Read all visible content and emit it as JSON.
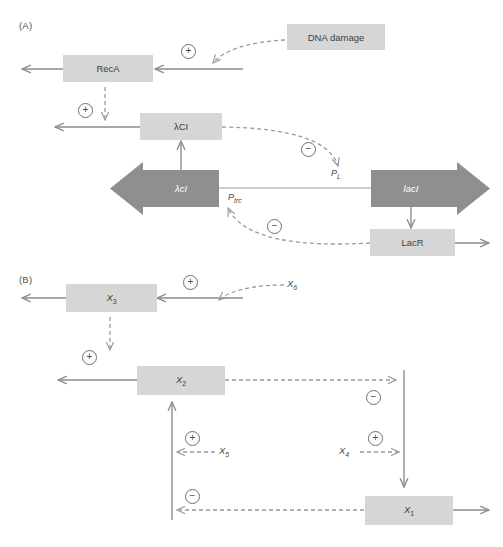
{
  "figure": {
    "top_cut_text": "",
    "panels": [
      {
        "id": "A",
        "label": "(A)"
      },
      {
        "id": "B",
        "label": "(B)"
      }
    ]
  },
  "panel_a": {
    "label": "(A)",
    "nodes": [
      {
        "name": "dna-damage",
        "text": "DNA damage",
        "style": "light"
      },
      {
        "name": "reca",
        "text": "RecA",
        "style": "light"
      },
      {
        "name": "lambda-ci-protein",
        "text": "λCI",
        "style": "light"
      },
      {
        "name": "lambda-ci-gene",
        "text": "λcI",
        "style": "dark-arrow-left"
      },
      {
        "name": "laci-gene",
        "text": "lacI",
        "style": "dark-arrow-right"
      },
      {
        "name": "lacr",
        "text": "LacR",
        "style": "light"
      }
    ],
    "promoters": [
      {
        "name": "promoter-pl",
        "base": "P",
        "sub": "L"
      },
      {
        "name": "promoter-ptrc",
        "base": "P",
        "sub": "trc"
      }
    ],
    "signs": [
      {
        "name": "sign-plus-dna-damage-reca",
        "symbol": "+"
      },
      {
        "name": "sign-plus-reca-lambdaci",
        "symbol": "+"
      },
      {
        "name": "sign-minus-lambdaci-pl",
        "symbol": "−"
      },
      {
        "name": "sign-minus-lacr-ptrc",
        "symbol": "−"
      }
    ]
  },
  "panel_b": {
    "label": "(B)",
    "nodes": [
      {
        "name": "node-x3",
        "base": "X",
        "sub": "3",
        "style": "light"
      },
      {
        "name": "node-x2",
        "base": "X",
        "sub": "2",
        "style": "light"
      },
      {
        "name": "node-x1",
        "base": "X",
        "sub": "1",
        "style": "light"
      }
    ],
    "free_labels": [
      {
        "name": "label-x6",
        "base": "X",
        "sub": "6"
      },
      {
        "name": "label-x5",
        "base": "X",
        "sub": "5"
      },
      {
        "name": "label-x4",
        "base": "X",
        "sub": "4"
      }
    ],
    "signs": [
      {
        "name": "sign-plus-x6-x3",
        "symbol": "+"
      },
      {
        "name": "sign-plus-x3-x2",
        "symbol": "+"
      },
      {
        "name": "sign-minus-x2-x1branch",
        "symbol": "−"
      },
      {
        "name": "sign-plus-x5",
        "symbol": "+"
      },
      {
        "name": "sign-plus-x4",
        "symbol": "+"
      },
      {
        "name": "sign-minus-x1-x2branch",
        "symbol": "−"
      }
    ]
  },
  "colors": {
    "node_light": "#d6d6d6",
    "node_dark": "#8f8f8f",
    "line_solid": "#8d8d8d",
    "line_dashed": "#9b9b9b",
    "text": "#3f3f3f",
    "background": "#ffffff"
  }
}
